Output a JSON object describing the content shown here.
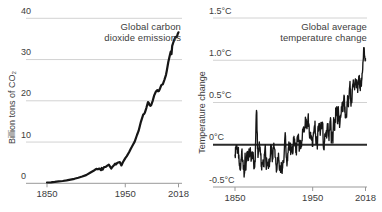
{
  "colors": {
    "background": "#ffffff",
    "grid": "#d2d2d2",
    "axis": "#999999",
    "text": "#3d3d3d",
    "data_line": "#161616",
    "zero_line": "#2b2b2b"
  },
  "charts": [
    {
      "name": "co2-emissions",
      "title_lines": [
        "Global carbon",
        "dioxide emissions"
      ],
      "y_axis_title": "Billion tons of CO₂"
    },
    {
      "name": "temperature-change",
      "title_lines": [
        "Global average",
        "temperature change"
      ],
      "y_axis_title": "Temperature change"
    }
  ],
  "chart_data": [
    {
      "type": "line",
      "title": "Global carbon dioxide emissions",
      "ylabel": "Billion tons of CO₂",
      "ylim": [
        0,
        40
      ],
      "xlim": [
        1850,
        2018
      ],
      "yticks": [
        {
          "v": 40,
          "label": "40"
        },
        {
          "v": 30,
          "label": "30"
        },
        {
          "v": 20,
          "label": "20"
        },
        {
          "v": 10,
          "label": "10"
        },
        {
          "v": 0,
          "label": "0"
        }
      ],
      "xticks": [
        {
          "v": 1850,
          "label": "1850"
        },
        {
          "v": 1950,
          "label": "1950"
        },
        {
          "v": 2018,
          "label": "2018"
        }
      ],
      "grid": true,
      "legend": "none",
      "series": [
        {
          "name": "Global CO2 emissions, billion tons per year",
          "points": [
            [
              1850,
              0.2
            ],
            [
              1855,
              0.25
            ],
            [
              1860,
              0.35
            ],
            [
              1865,
              0.45
            ],
            [
              1870,
              0.55
            ],
            [
              1875,
              0.7
            ],
            [
              1880,
              0.9
            ],
            [
              1885,
              1.1
            ],
            [
              1890,
              1.35
            ],
            [
              1895,
              1.65
            ],
            [
              1900,
              2.0
            ],
            [
              1905,
              2.55
            ],
            [
              1910,
              3.1
            ],
            [
              1913,
              3.5
            ],
            [
              1915,
              3.4
            ],
            [
              1917,
              3.6
            ],
            [
              1919,
              3.2
            ],
            [
              1920,
              3.7
            ],
            [
              1921,
              3.3
            ],
            [
              1923,
              3.95
            ],
            [
              1925,
              4.0
            ],
            [
              1927,
              4.3
            ],
            [
              1929,
              4.5
            ],
            [
              1931,
              3.9
            ],
            [
              1932,
              3.6
            ],
            [
              1934,
              4.1
            ],
            [
              1936,
              4.5
            ],
            [
              1937,
              4.75
            ],
            [
              1938,
              4.55
            ],
            [
              1940,
              5.0
            ],
            [
              1943,
              5.15
            ],
            [
              1945,
              4.35
            ],
            [
              1947,
              5.1
            ],
            [
              1950,
              6.1
            ],
            [
              1952,
              6.6
            ],
            [
              1955,
              7.6
            ],
            [
              1957,
              8.4
            ],
            [
              1960,
              9.4
            ],
            [
              1962,
              10.1
            ],
            [
              1965,
              11.7
            ],
            [
              1967,
              12.7
            ],
            [
              1970,
              14.9
            ],
            [
              1973,
              16.7
            ],
            [
              1974,
              16.8
            ],
            [
              1975,
              17.1
            ],
            [
              1977,
              18.3
            ],
            [
              1979,
              19.7
            ],
            [
              1980,
              19.5
            ],
            [
              1981,
              19.0
            ],
            [
              1982,
              18.8
            ],
            [
              1983,
              18.9
            ],
            [
              1985,
              20.0
            ],
            [
              1987,
              21.3
            ],
            [
              1989,
              22.2
            ],
            [
              1990,
              22.4
            ],
            [
              1991,
              22.6
            ],
            [
              1992,
              22.3
            ],
            [
              1993,
              22.4
            ],
            [
              1994,
              22.8
            ],
            [
              1996,
              23.8
            ],
            [
              1998,
              24.0
            ],
            [
              2000,
              25.1
            ],
            [
              2002,
              26.3
            ],
            [
              2003,
              27.3
            ],
            [
              2005,
              29.4
            ],
            [
              2007,
              31.1
            ],
            [
              2008,
              31.9
            ],
            [
              2009,
              31.3
            ],
            [
              2010,
              33.3
            ],
            [
              2012,
              34.5
            ],
            [
              2014,
              35.5
            ],
            [
              2015,
              35.4
            ],
            [
              2016,
              35.5
            ],
            [
              2017,
              36.2
            ],
            [
              2018,
              36.6
            ]
          ]
        }
      ]
    },
    {
      "type": "line",
      "title": "Global average temperature change",
      "ylabel": "Temperature change",
      "ylim": [
        -0.5,
        1.5
      ],
      "xlim": [
        1850,
        2018
      ],
      "yticks": [
        {
          "v": 1.5,
          "label": "1.5°C"
        },
        {
          "v": 1.0,
          "label": "1.0°C"
        },
        {
          "v": 0.5,
          "label": "0.5°C"
        },
        {
          "v": 0,
          "label": "0°C",
          "emphasis": true
        },
        {
          "v": -0.5,
          "label": "-0.5°C"
        }
      ],
      "xticks": [
        {
          "v": 1850,
          "label": "1850"
        },
        {
          "v": 1950,
          "label": "1950"
        },
        {
          "v": 2018,
          "label": "2018"
        }
      ],
      "grid": true,
      "legend": "none",
      "zero_line": true,
      "series": [
        {
          "name": "Global average temperature anomaly, °C",
          "start_year": 1850,
          "annual_values": [
            -0.12,
            -0.05,
            -0.05,
            -0.1,
            -0.08,
            -0.12,
            -0.22,
            -0.3,
            -0.18,
            -0.05,
            -0.18,
            -0.25,
            -0.35,
            -0.1,
            -0.3,
            -0.12,
            -0.08,
            -0.15,
            -0.05,
            -0.1,
            -0.08,
            -0.18,
            -0.1,
            -0.12,
            -0.2,
            -0.25,
            -0.2,
            0.25,
            0.38,
            -0.05,
            -0.1,
            -0.02,
            -0.05,
            -0.12,
            -0.25,
            -0.22,
            -0.18,
            -0.25,
            -0.12,
            0.0,
            -0.25,
            -0.18,
            -0.25,
            -0.28,
            -0.22,
            -0.2,
            0.0,
            -0.02,
            -0.2,
            -0.05,
            0.02,
            -0.05,
            -0.15,
            -0.25,
            -0.3,
            -0.15,
            -0.1,
            -0.28,
            -0.25,
            -0.28,
            -0.25,
            -0.28,
            -0.2,
            -0.18,
            0.05,
            0.1,
            -0.15,
            -0.25,
            -0.1,
            -0.02,
            -0.05,
            0.02,
            -0.1,
            -0.05,
            -0.08,
            0.0,
            0.1,
            0.0,
            0.02,
            -0.12,
            0.08,
            0.1,
            0.05,
            -0.05,
            0.05,
            0.0,
            0.05,
            0.18,
            0.2,
            0.15,
            0.2,
            0.3,
            0.2,
            0.22,
            0.32,
            0.25,
            0.08,
            0.12,
            0.1,
            0.05,
            -0.02,
            0.15,
            0.2,
            0.28,
            0.05,
            0.02,
            -0.05,
            0.22,
            0.25,
            0.2,
            0.15,
            0.22,
            0.2,
            0.25,
            -0.05,
            0.02,
            0.1,
            0.15,
            0.08,
            0.25,
            0.18,
            0.05,
            0.18,
            0.32,
            0.02,
            0.15,
            0.02,
            0.32,
            0.2,
            0.3,
            0.4,
            0.45,
            0.25,
            0.45,
            0.28,
            0.25,
            0.32,
            0.45,
            0.5,
            0.4,
            0.55,
            0.52,
            0.32,
            0.35,
            0.42,
            0.58,
            0.45,
            0.6,
            0.75,
            0.52,
            0.52,
            0.65,
            0.72,
            0.72,
            0.65,
            0.78,
            0.72,
            0.75,
            0.62,
            0.75,
            0.82,
            0.68,
            0.72,
            0.75,
            0.85,
            1.0,
            1.15,
            1.05,
            1.02
          ]
        }
      ]
    }
  ]
}
